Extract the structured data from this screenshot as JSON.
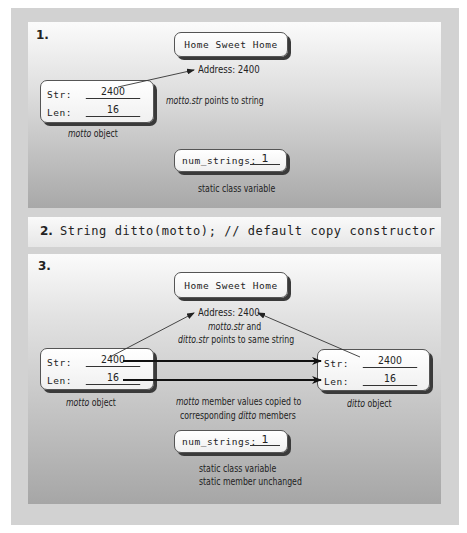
{
  "colors": {
    "frame": "#d2d2d2",
    "panel_top": "#fbfbfb",
    "panel_bottom": "#a8a8a8",
    "box_shadow": "#3a3a3a",
    "text": "#222222"
  },
  "step1": {
    "number": "1.",
    "string_box": {
      "text": "Home Sweet Home"
    },
    "address_label": "Address: 2400",
    "motto_object": {
      "str_label": "Str:",
      "str_value": "2400",
      "len_label": "Len:",
      "len_value": "16",
      "caption_italic": "motto",
      "caption_rest": " object"
    },
    "pointer_caption_italic": "motto.str",
    "pointer_caption_rest": " points to string",
    "static_box": {
      "label": "num_strings:",
      "value": "1"
    },
    "static_caption": "static class variable"
  },
  "step2": {
    "number": "2.",
    "code": "String ditto(motto); // default copy constructor"
  },
  "step3": {
    "number": "3.",
    "string_box": {
      "text": "Home Sweet Home"
    },
    "address_label": "Address: 2400",
    "pointer_caption_line1_italic": "motto.str",
    "pointer_caption_line1_rest": " and",
    "pointer_caption_line2_italic": "ditto.str",
    "pointer_caption_line2_rest": " points to same string",
    "motto_object": {
      "str_label": "Str:",
      "str_value": "2400",
      "len_label": "Len:",
      "len_value": "16",
      "caption_italic": "motto",
      "caption_rest": " object"
    },
    "ditto_object": {
      "str_label": "Str:",
      "str_value": "2400",
      "len_label": "Len:",
      "len_value": "16",
      "caption_italic": "ditto",
      "caption_rest": " object"
    },
    "copy_caption_line1_italic": "motto",
    "copy_caption_line1_rest": " member values copied to",
    "copy_caption_line2_pre": "corresponding ",
    "copy_caption_line2_italic": "ditto",
    "copy_caption_line2_rest": " members",
    "static_box": {
      "label": "num_strings:",
      "value": "1"
    },
    "static_caption_line1": "static class variable",
    "static_caption_line2": "static member unchanged"
  }
}
